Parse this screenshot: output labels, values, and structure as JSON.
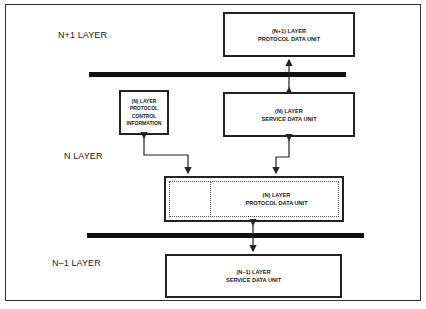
{
  "diagram": {
    "layers": [
      {
        "id": "n_plus_1",
        "label": "N+1 LAYER"
      },
      {
        "id": "n",
        "label": "N LAYER"
      },
      {
        "id": "n_minus_1",
        "label": "N–1 LAYER"
      }
    ],
    "boxes": {
      "n_plus_1_pdu": {
        "line1": "(N+1) LAYER",
        "line2": "PROTOCOL DATA UNIT"
      },
      "n_sdu": {
        "line1": "(N) LAYER",
        "line2": "SERVICE DATA UNIT"
      },
      "n_pci": {
        "line1": "(N) LAYER",
        "line2": "PROTOCOL",
        "line3": "CONTROL",
        "line4": "INFORMATION"
      },
      "n_pdu": {
        "line1": "(N) LAYER",
        "line2": "PROTOCOL DATA UNIT"
      },
      "n_minus_1_sdu": {
        "line1": "(N–1) LAYER",
        "line2": "SERVICE DATA UNIT"
      }
    },
    "connections": [
      {
        "from": "n_plus_1_pdu",
        "to": "n_sdu",
        "type": "bidirectional"
      },
      {
        "from": "n_pci",
        "to": "n_pdu",
        "type": "bidirectional"
      },
      {
        "from": "n_sdu",
        "to": "n_pdu",
        "type": "bidirectional"
      },
      {
        "from": "n_pdu",
        "to": "n_minus_1_sdu",
        "type": "bidirectional"
      }
    ],
    "colors": {
      "stroke": "#222222",
      "background": "#ffffff"
    }
  }
}
